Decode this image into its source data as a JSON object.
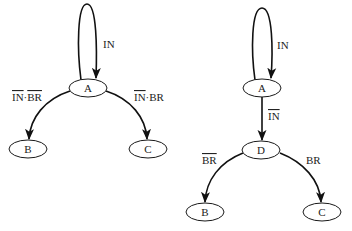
{
  "diagrams": [
    {
      "id": "left",
      "nodes": [
        {
          "id": "A",
          "label": "A"
        },
        {
          "id": "B",
          "label": "B"
        },
        {
          "id": "C",
          "label": "C"
        }
      ],
      "edges": [
        {
          "from": "A",
          "to": "A",
          "label_parts": [
            {
              "text": "IN",
              "overline": false
            }
          ]
        },
        {
          "from": "A",
          "to": "B",
          "label_parts": [
            {
              "text": "IN",
              "overline": true
            },
            {
              "text": "·",
              "overline": false
            },
            {
              "text": "BR",
              "overline": true
            }
          ]
        },
        {
          "from": "A",
          "to": "C",
          "label_parts": [
            {
              "text": "IN",
              "overline": true
            },
            {
              "text": "·",
              "overline": false
            },
            {
              "text": "BR",
              "overline": false
            }
          ]
        }
      ]
    },
    {
      "id": "right",
      "nodes": [
        {
          "id": "A",
          "label": "A"
        },
        {
          "id": "D",
          "label": "D"
        },
        {
          "id": "B",
          "label": "B"
        },
        {
          "id": "C",
          "label": "C"
        }
      ],
      "edges": [
        {
          "from": "A",
          "to": "A",
          "label_parts": [
            {
              "text": "IN",
              "overline": false
            }
          ]
        },
        {
          "from": "A",
          "to": "D",
          "label_parts": [
            {
              "text": "IN",
              "overline": true
            }
          ]
        },
        {
          "from": "D",
          "to": "B",
          "label_parts": [
            {
              "text": "BR",
              "overline": true
            }
          ]
        },
        {
          "from": "D",
          "to": "C",
          "label_parts": [
            {
              "text": "BR",
              "overline": false
            }
          ]
        }
      ]
    }
  ]
}
